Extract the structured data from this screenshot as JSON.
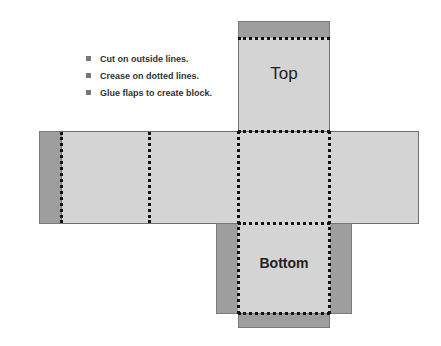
{
  "instructions": [
    "Cut on outside lines.",
    "Crease on dotted lines.",
    "Glue flaps to create block."
  ],
  "faces": {
    "top": "Top",
    "bottom": "Bottom"
  },
  "colors": {
    "face": "#d4d4d4",
    "flap": "#9e9e9e",
    "fold_line": "#111111"
  }
}
